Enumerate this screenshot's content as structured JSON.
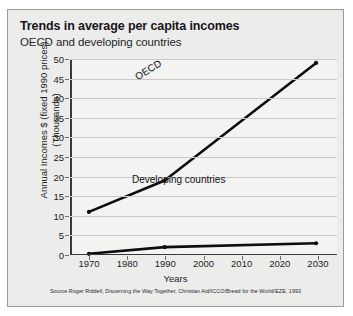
{
  "header": {
    "title": "Trends in average per capita incomes",
    "subtitle": "OECD and developing countries"
  },
  "source_note": "Source Roger Riddell, Discerning the Way Together, Christian Aid/ICCO/Bread for the World/EZE, 1993",
  "chart_data": {
    "type": "line",
    "title": "Trends in average per capita incomes",
    "subtitle": "OECD and developing countries",
    "xlabel": "Years",
    "ylabel": "Annual Incomes $ (fixed 1990 prices) (Thousands)",
    "ylabel_line1": "Annual Incomes $ (fixed 1990 prices)",
    "ylabel_line2": "(Thousands)",
    "x": [
      1970,
      1990,
      2030
    ],
    "xlim": [
      1965,
      2035
    ],
    "xticks": [
      1970,
      1980,
      1990,
      2000,
      2010,
      2020,
      2030
    ],
    "ylim": [
      0,
      50
    ],
    "yticks": [
      0,
      5,
      10,
      15,
      20,
      25,
      30,
      35,
      40,
      45,
      50
    ],
    "grid": true,
    "legend": "inline-labels",
    "series": [
      {
        "name": "OECD",
        "values": [
          11,
          19,
          49
        ],
        "color": "#0d0d10",
        "markers": true
      },
      {
        "name": "Developing countries",
        "values": [
          0.3,
          2,
          3
        ],
        "color": "#0d0d10",
        "markers": true
      }
    ],
    "annotations": [
      {
        "text": "OECD",
        "series": "OECD",
        "rotated": true
      },
      {
        "text": "Developing countries",
        "series": "Developing countries",
        "rotated": false
      }
    ]
  },
  "colors": {
    "panel_background": "#ececeb",
    "plot_background": "#f3f3f2",
    "grid": "#c9c9c7",
    "axis": "#3a3a3c",
    "series": "#0d0d10"
  }
}
